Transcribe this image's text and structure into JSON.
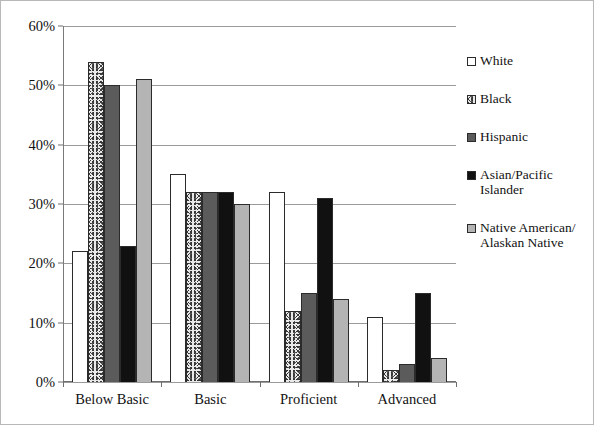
{
  "chart_data": {
    "type": "bar",
    "title": "",
    "subtitle": "",
    "xlabel": "",
    "ylabel": "",
    "categories": [
      "Below Basic",
      "Basic",
      "Proficient",
      "Advanced"
    ],
    "ylim": [
      0,
      60
    ],
    "ytick_labels": [
      "0%",
      "10%",
      "20%",
      "30%",
      "40%",
      "50%",
      "60%"
    ],
    "ytick_values": [
      0,
      10,
      20,
      30,
      40,
      50,
      60
    ],
    "grid": true,
    "grid_axis": "y",
    "legend_position": "right",
    "value_suffix": "%",
    "series": [
      {
        "name": "White",
        "fill": "white",
        "swatch": "fill-white",
        "values": [
          22,
          35,
          32,
          11
        ]
      },
      {
        "name": "Black",
        "fill": "speckle",
        "swatch": "fill-speckle",
        "values": [
          54,
          32,
          12,
          2
        ]
      },
      {
        "name": "Hispanic",
        "fill": "darkgray",
        "swatch": "fill-darkgray",
        "values": [
          50,
          32,
          15,
          3
        ]
      },
      {
        "name": "Asian/Pacific Islander",
        "fill": "black",
        "swatch": "fill-black",
        "values": [
          23,
          32,
          31,
          15
        ]
      },
      {
        "name": "Native American/ Alaskan Native",
        "fill": "lightgray",
        "swatch": "fill-lightgray",
        "values": [
          51,
          30,
          14,
          4
        ]
      }
    ]
  },
  "legend": {
    "items": [
      {
        "label": "White",
        "swatch": "fill-white"
      },
      {
        "label": "Black",
        "swatch": "fill-speckle"
      },
      {
        "label": "Hispanic",
        "swatch": "fill-darkgray"
      },
      {
        "label": "Asian/Pacific Islander",
        "swatch": "fill-black"
      },
      {
        "label": "Native American/ Alaskan Native",
        "swatch": "fill-lightgray"
      }
    ]
  },
  "colors": {
    "gridline": "#9a9a9a",
    "axis": "#6e6e6e",
    "text": "#121212",
    "bar_outline": "#2b2b2b",
    "frame_border": "#b8b8b8"
  }
}
